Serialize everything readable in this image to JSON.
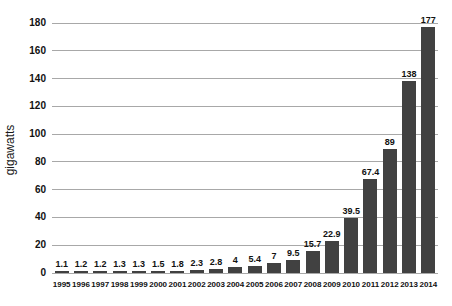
{
  "chart": {
    "ylabel": "gigawatts"
  },
  "chart_data": {
    "type": "bar",
    "title": "",
    "xlabel": "",
    "ylabel": "gigawatts",
    "categories": [
      "1995",
      "1996",
      "1997",
      "1998",
      "1999",
      "2000",
      "2001",
      "2002",
      "2003",
      "2004",
      "2005",
      "2006",
      "2007",
      "2008",
      "2009",
      "2010",
      "2011",
      "2012",
      "2013",
      "2014"
    ],
    "values": [
      1.1,
      1.2,
      1.2,
      1.3,
      1.3,
      1.5,
      1.8,
      2.3,
      2.8,
      4,
      5.4,
      7,
      9.5,
      15.7,
      22.9,
      39.5,
      67.4,
      89,
      138,
      177
    ],
    "value_labels": [
      "1.1",
      "1.2",
      "1.2",
      "1.3",
      "1.3",
      "1.5",
      "1.8",
      "2.3",
      "2.8",
      "4",
      "5.4",
      "7",
      "9.5",
      "15.7",
      "22.9",
      "39.5",
      "67.4",
      "89",
      "138",
      "177"
    ],
    "ylim": [
      0,
      180
    ],
    "yticks": [
      0,
      20,
      40,
      60,
      80,
      100,
      120,
      140,
      160,
      180
    ],
    "grid": true,
    "legend": false,
    "bar_color": "#414141",
    "grid_color": "#a8a8a8",
    "text_color": "#111111"
  }
}
